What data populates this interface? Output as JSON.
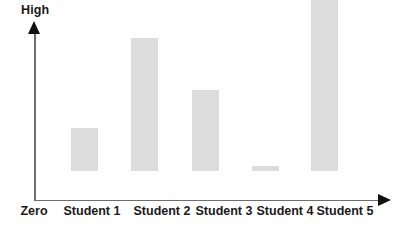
{
  "chart_data": {
    "type": "bar",
    "title": "",
    "xlabel": "",
    "ylabel": "Knowledge of the event",
    "y_axis_top_label": "High",
    "y_axis_bottom_label": "Zero",
    "origin_label": "Zero",
    "categories": [
      "Student 1",
      "Student 2",
      "Student 3",
      "Student 4",
      "Student 5"
    ],
    "values": [
      25,
      77,
      47,
      3,
      100
    ],
    "ylim": [
      0,
      100
    ],
    "grid": false,
    "legend": false,
    "bar_color": "#dcdcdc",
    "axis_color": "#6e6e6e",
    "arrow_color": "#111111",
    "text_color": "#1a1a1a",
    "background_color": "#ffffff",
    "bars": [
      {
        "label": "Student 1",
        "value": 25,
        "x": 71,
        "top": 157,
        "width": 27
      },
      {
        "label": "Student 2",
        "value": 77,
        "x": 131,
        "top": 67,
        "width": 27
      },
      {
        "label": "Student 3",
        "value": 47,
        "x": 192,
        "top": 119,
        "width": 27
      },
      {
        "label": "Student 4",
        "value": 3,
        "x": 252,
        "top": 195,
        "width": 27
      },
      {
        "label": "Student 5",
        "value": 100,
        "x": 311,
        "top": 28,
        "width": 27
      }
    ],
    "axis_tick_labels": [
      "Zero",
      "Student 1",
      "Student 2",
      "Student 3",
      "Student 4",
      "Student 5"
    ],
    "tick_label_positions": [
      {
        "text": "Zero",
        "center": 34
      },
      {
        "text": "Student 1",
        "center": 92
      },
      {
        "text": "Student 2",
        "center": 162
      },
      {
        "text": "Student 3",
        "center": 224
      },
      {
        "text": "Student 4",
        "center": 285
      },
      {
        "text": "Student 5",
        "center": 345
      }
    ]
  }
}
